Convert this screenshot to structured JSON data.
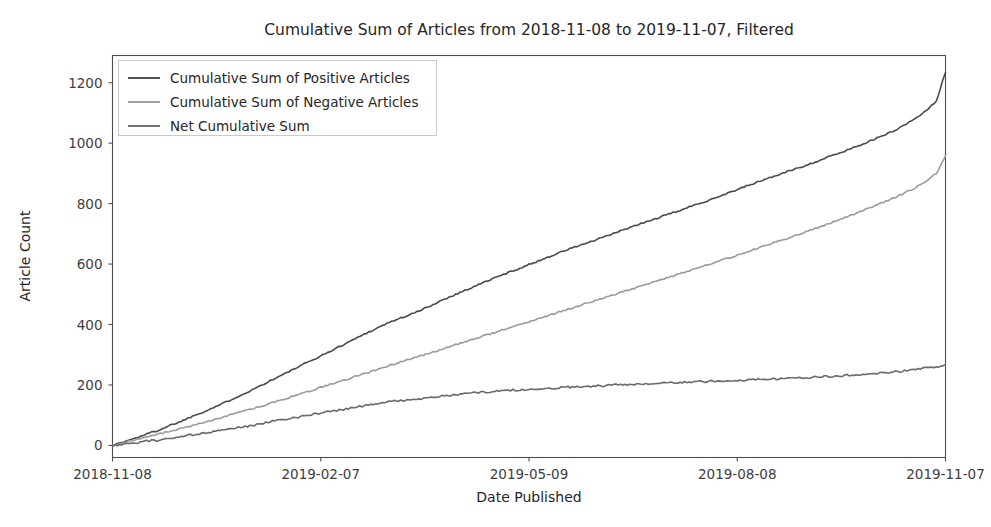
{
  "chart_data": {
    "type": "line",
    "title": "Cumulative Sum of Articles from 2018-11-08 to 2019-11-07, Filtered",
    "xlabel": "Date Published",
    "ylabel": "Article Count",
    "grid": false,
    "legend_position": "upper left",
    "xlim": [
      "2018-11-08",
      "2019-11-07"
    ],
    "ylim": [
      -40,
      1290
    ],
    "yticks": [
      0,
      200,
      400,
      600,
      800,
      1000,
      1200
    ],
    "ytick_labels": [
      "0",
      "200",
      "400",
      "600",
      "800",
      "1000",
      "1200"
    ],
    "xticks": [
      "2018-11-08",
      "2019-02-07",
      "2019-05-09",
      "2019-08-08",
      "2019-11-07"
    ],
    "xtick_labels": [
      "2018-11-08",
      "2019-02-07",
      "2019-05-09",
      "2019-08-08",
      "2019-11-07"
    ],
    "x": [
      0,
      5,
      10,
      15,
      20,
      25,
      30,
      35,
      40,
      45,
      50,
      55,
      60,
      65,
      70,
      75,
      80,
      85,
      90,
      95,
      100,
      105,
      110,
      115,
      120,
      125,
      130,
      135,
      140,
      145,
      150,
      155,
      160,
      165,
      170,
      175,
      180,
      185,
      190,
      195,
      200,
      205,
      210,
      215,
      220,
      225,
      230,
      235,
      240,
      245,
      250,
      255,
      260,
      265,
      270,
      275,
      280,
      285,
      290,
      295,
      300,
      305,
      310,
      315,
      320,
      325,
      330,
      335,
      340,
      345,
      350,
      355,
      360,
      364
    ],
    "series": [
      {
        "name": "Cumulative Sum of Positive Articles",
        "color": "#4a4a4a",
        "final_value": 1234,
        "values": [
          0,
          12,
          24,
          38,
          50,
          66,
          80,
          97,
          112,
          128,
          145,
          163,
          180,
          199,
          218,
          236,
          255,
          274,
          292,
          311,
          330,
          349,
          368,
          386,
          404,
          419,
          432,
          448,
          466,
          484,
          500,
          516,
          532,
          548,
          563,
          578,
          592,
          607,
          622,
          637,
          651,
          664,
          676,
          690,
          704,
          718,
          731,
          744,
          757,
          770,
          783,
          797,
          810,
          824,
          838,
          852,
          866,
          880,
          893,
          906,
          919,
          932,
          946,
          960,
          974,
          989,
          1004,
          1019,
          1036,
          1055,
          1078,
          1104,
          1140,
          1234
        ]
      },
      {
        "name": "Cumulative Sum of Negative Articles",
        "color": "#9a9a9a",
        "final_value": 958,
        "values": [
          0,
          10,
          19,
          28,
          37,
          47,
          56,
          66,
          76,
          86,
          97,
          108,
          119,
          130,
          142,
          153,
          165,
          177,
          189,
          201,
          213,
          225,
          237,
          249,
          261,
          273,
          285,
          297,
          309,
          321,
          333,
          345,
          357,
          369,
          381,
          393,
          405,
          417,
          429,
          441,
          453,
          465,
          477,
          489,
          501,
          513,
          525,
          537,
          549,
          561,
          573,
          585,
          597,
          610,
          622,
          634,
          647,
          660,
          673,
          686,
          699,
          712,
          726,
          740,
          754,
          768,
          783,
          798,
          814,
          831,
          850,
          872,
          900,
          958
        ]
      },
      {
        "name": "Net Cumulative Sum",
        "color": "#6a6a6a",
        "final_value": 268,
        "values": [
          0,
          4,
          8,
          14,
          18,
          25,
          30,
          36,
          40,
          46,
          52,
          59,
          64,
          72,
          80,
          86,
          92,
          99,
          105,
          112,
          118,
          126,
          131,
          138,
          145,
          148,
          150,
          153,
          159,
          165,
          168,
          172,
          175,
          178,
          180,
          183,
          184,
          186,
          188,
          191,
          193,
          195,
          196,
          198,
          200,
          202,
          203,
          205,
          206,
          208,
          209,
          211,
          212,
          213,
          215,
          216,
          217,
          219,
          220,
          222,
          223,
          225,
          227,
          229,
          231,
          234,
          236,
          239,
          242,
          246,
          250,
          255,
          258,
          268
        ]
      }
    ]
  },
  "figure": {
    "background": "#ffffff",
    "axes_color": "#4d4d4d"
  }
}
